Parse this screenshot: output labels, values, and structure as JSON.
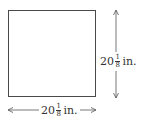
{
  "diagram": {
    "shape": "square",
    "width_label": {
      "whole": "20",
      "numerator": "1",
      "denominator": "8",
      "unit": "in."
    },
    "height_label": {
      "whole": "20",
      "numerator": "1",
      "denominator": "8",
      "unit": "in."
    },
    "colors": {
      "stroke": "#4a4a4a",
      "text": "#333333",
      "background": "#ffffff"
    }
  }
}
